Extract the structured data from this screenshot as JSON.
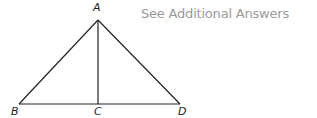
{
  "note": {
    "text": "See Additional Answers",
    "color": "#9a9a9a"
  },
  "diagram": {
    "type": "triangle-with-altitude",
    "points": {
      "A": {
        "label": "A",
        "x": 98,
        "y": 20
      },
      "B": {
        "label": "B",
        "x": 19,
        "y": 104
      },
      "C": {
        "label": "C",
        "x": 98,
        "y": 104
      },
      "D": {
        "label": "D",
        "x": 180,
        "y": 104
      }
    },
    "segments": [
      "AB",
      "AD",
      "BD",
      "AC"
    ]
  }
}
